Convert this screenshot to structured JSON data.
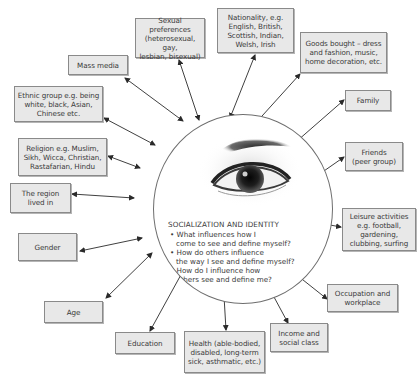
{
  "diagram": {
    "center": {
      "title": "SOCIALIZATION AND IDENTITY",
      "questions": [
        "• What influences how I\ncome to see and define myself?",
        "• How do others influence\nthe way I see and define myself?",
        "• How do I influence how\nothers see and define me?"
      ],
      "image": "eye-icon"
    },
    "nodes": [
      {
        "id": "sexual-preferences",
        "label": "Sexual preferences\n(heterosexual, gay,\nlesbian, bisexual)"
      },
      {
        "id": "mass-media",
        "label": "Mass media"
      },
      {
        "id": "nationality",
        "label": "Nationality, e.g.\nEnglish, British,\nScottish, Indian,\nWelsh, Irish"
      },
      {
        "id": "goods-bought",
        "label": "Goods bought – dress\nand fashion, music,\nhome decoration, etc."
      },
      {
        "id": "family",
        "label": "Family"
      },
      {
        "id": "ethnic-group",
        "label": "Ethnic group e.g. being\nwhite, black, Asian,\nChinese etc."
      },
      {
        "id": "friends",
        "label": "Friends\n(peer group)"
      },
      {
        "id": "religion",
        "label": "Religion e.g. Muslim,\nSikh, Wicca, Christian,\nRastafarian, Hindu"
      },
      {
        "id": "region",
        "label": "The region\nlived in"
      },
      {
        "id": "leisure",
        "label": "Leisure activities\ne.g. football,\ngardening,\nclubbing, surfing"
      },
      {
        "id": "gender",
        "label": "Gender"
      },
      {
        "id": "occupation",
        "label": "Occupation and\nworkplace"
      },
      {
        "id": "age",
        "label": "Age"
      },
      {
        "id": "education",
        "label": "Education"
      },
      {
        "id": "health",
        "label": "Health (able-bodied,\ndisabled, long-term\nsick, asthmatic, etc.)"
      },
      {
        "id": "income",
        "label": "Income and\nsocial class"
      }
    ],
    "colors": {
      "box_fill": "#e8e8e8",
      "box_border": "#8a8a8a",
      "text": "#3a3a3a",
      "arrow": "#2a2a2a",
      "circle_border": "#6e6e6e"
    }
  }
}
